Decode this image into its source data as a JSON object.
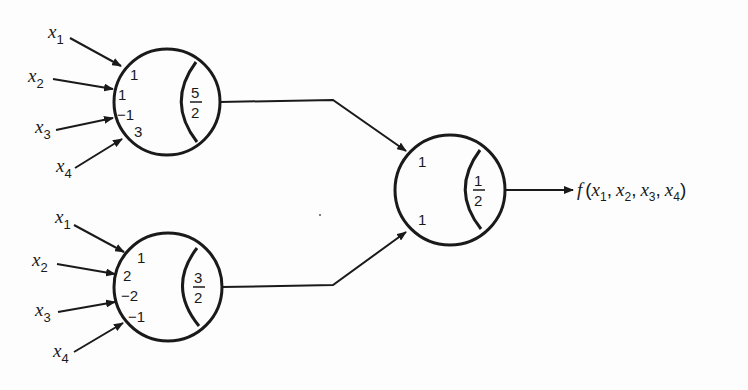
{
  "diagram": {
    "type": "threshold-logic-network",
    "neurons": [
      {
        "id": "n1",
        "inputs": [
          "x1",
          "x2",
          "x3",
          "x4"
        ],
        "weights": [
          "1",
          "1",
          "−1",
          "3"
        ],
        "threshold": {
          "num": "5",
          "den": "2"
        }
      },
      {
        "id": "n2",
        "inputs": [
          "x1",
          "x2",
          "x3",
          "x4"
        ],
        "weights": [
          "1",
          "2",
          "−2",
          "−1"
        ],
        "threshold": {
          "num": "3",
          "den": "2"
        }
      },
      {
        "id": "n3",
        "inputs": [
          "n1",
          "n2"
        ],
        "weights": [
          "1",
          "1"
        ],
        "threshold": {
          "num": "1",
          "den": "2"
        }
      }
    ],
    "input_labels": [
      {
        "base": "x",
        "sub": "1"
      },
      {
        "base": "x",
        "sub": "2"
      },
      {
        "base": "x",
        "sub": "3"
      },
      {
        "base": "x",
        "sub": "4"
      }
    ],
    "output": {
      "func": "f",
      "open": "(",
      "close": ")",
      "args": [
        {
          "base": "x",
          "sub": "1"
        },
        {
          "base": "x",
          "sub": "2"
        },
        {
          "base": "x",
          "sub": "3"
        },
        {
          "base": "x",
          "sub": "4"
        }
      ],
      "sep": ","
    }
  }
}
